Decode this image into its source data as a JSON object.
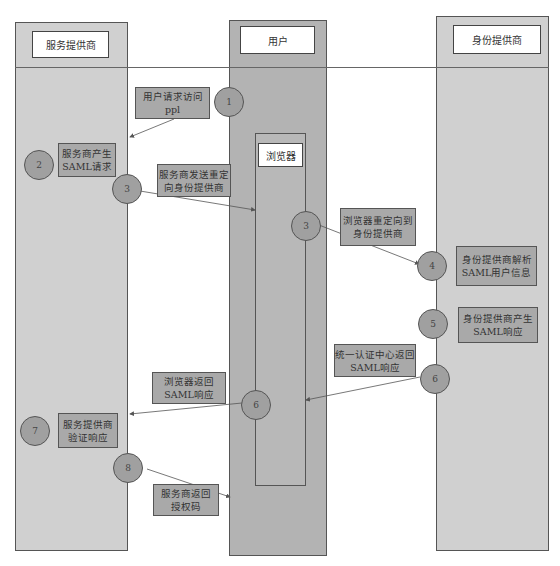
{
  "lanes": {
    "service_provider": {
      "label": "服务提供商"
    },
    "user": {
      "label": "用户"
    },
    "browser": {
      "label": "浏览器"
    },
    "identity_provider": {
      "label": "身份提供商"
    }
  },
  "steps": [
    {
      "number": "1",
      "text": "用户请求访问\nppl"
    },
    {
      "number": "2",
      "text": "服务商产生\nSAML请求"
    },
    {
      "number": "3",
      "text": "服务商发送重定\n向身份提供商"
    },
    {
      "number": "3",
      "text": "浏览器重定向到\n身份提供商"
    },
    {
      "number": "4",
      "text": "身份提供商解析\nSAML用户信息"
    },
    {
      "number": "5",
      "text": "身份提供商产生\nSAML响应"
    },
    {
      "number": "6",
      "text": "统一认证中心返回\nSAML响应"
    },
    {
      "number": "6",
      "text": "浏览器返回\nSAML响应"
    },
    {
      "number": "7",
      "text": "服务提供商\n验证响应"
    },
    {
      "number": "8",
      "text": "服务商返回\n授权码"
    }
  ],
  "colors": {
    "lane_light": "#d0d0d0",
    "lane_dark": "#b3b3b3",
    "note_fill": "#a9a9a9",
    "step_fill": "#a0a0a0"
  }
}
